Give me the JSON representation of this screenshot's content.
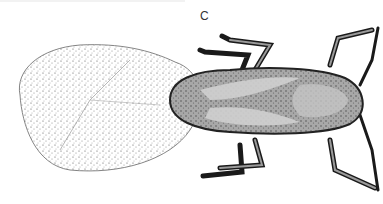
{
  "figure": {
    "panel_label": "C",
    "colors": {
      "background": "#ffffff",
      "ink": "#1a1a1a",
      "body_fill": "#9a9a9a",
      "body_light": "#c8c8c8",
      "wing_stipple": "#555555"
    }
  }
}
